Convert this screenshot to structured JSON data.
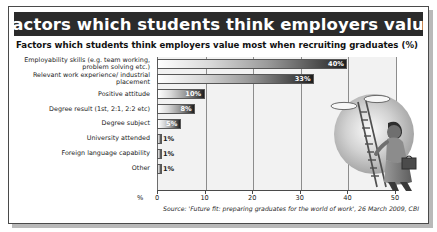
{
  "header": {
    "title": "Factors which students think employers value"
  },
  "subtitle": "Factors which students think employers value most when recruiting graduates (%)",
  "source": "Source: 'Future fit: preparing graduates for the world of work', 26 March 2009, CBI",
  "axis": {
    "percent_symbol": "%",
    "ticks": [
      "0",
      "10",
      "20",
      "30",
      "40",
      "50"
    ]
  },
  "illustration": {
    "name": "person-climbing-ladder-to-clouds"
  },
  "colors": {
    "title_bar": "#2b2b2b",
    "title_text": "#ffffff",
    "plot_background": "#f2f2f2",
    "bar_light": "#fefefe",
    "bar_dark": "#1e1e1e",
    "grid": "#8d8d8d",
    "frame": "#4a4a4a"
  },
  "chart_data": {
    "type": "bar",
    "orientation": "horizontal",
    "title": "Factors which students think employers value most when recruiting graduates (%)",
    "xlabel": "%",
    "ylabel": "",
    "xlim": [
      0,
      50
    ],
    "grid": true,
    "legend": false,
    "categories": [
      "Employability skills (e.g. team working, problem solving etc.)",
      "Relevant work experience/ industrial placement",
      "Positive attitude",
      "Degree result (1st, 2:1, 2:2 etc)",
      "Degree subject",
      "University attended",
      "Foreign language capability",
      "Other"
    ],
    "values": [
      40,
      33,
      10,
      8,
      5,
      1,
      1,
      1
    ],
    "value_labels": [
      "40%",
      "33%",
      "10%",
      "8%",
      "5%",
      "1%",
      "1%",
      "1%"
    ],
    "tick_values": [
      0,
      10,
      20,
      30,
      40,
      50
    ]
  }
}
